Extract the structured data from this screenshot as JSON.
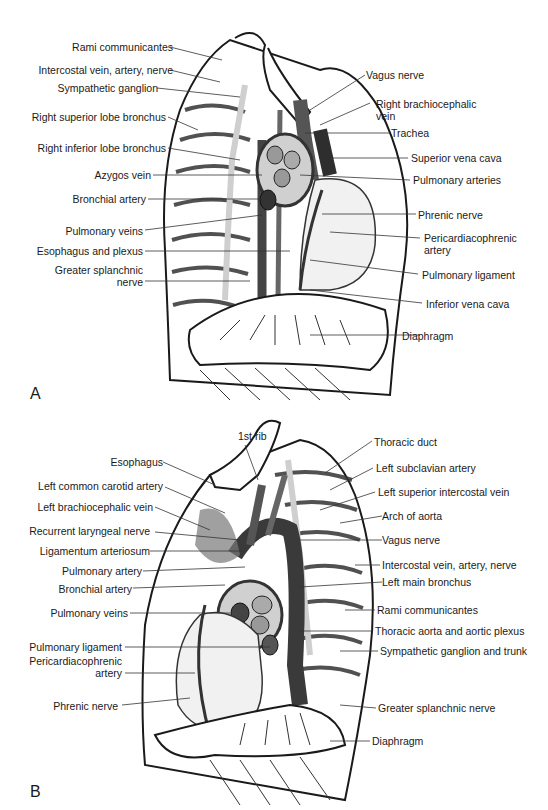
{
  "figure": {
    "panels": [
      {
        "letter": "A",
        "view": "right mediastinum (lateral)",
        "left_labels": [
          "Rami communicantes",
          "Intercostal vein, artery, nerve",
          "Sympathetic ganglion",
          "Right superior lobe bronchus",
          "Right inferior lobe bronchus",
          "Azygos vein",
          "Bronchial artery",
          "Pulmonary veins",
          "Esophagus and plexus",
          "Greater splanchnic",
          "nerve"
        ],
        "right_labels": [
          "Vagus nerve",
          "Right brachiocephalic",
          "vein",
          "Trachea",
          "Superior vena cava",
          "Pulmonary arteries",
          "Phrenic nerve",
          "Pericardiacophrenic",
          "artery",
          "Pulmonary ligament",
          "Inferior vena cava",
          "Diaphragm"
        ]
      },
      {
        "letter": "B",
        "view": "left mediastinum (lateral)",
        "top_labels": [
          "1st rib"
        ],
        "left_labels": [
          "Esophagus",
          "Left common carotid artery",
          "Left brachiocephalic vein",
          "Recurrent laryngeal nerve",
          "Ligamentum arteriosum",
          "Pulmonary artery",
          "Bronchial artery",
          "Pulmonary veins",
          "Pulmonary ligament",
          "Pericardiacophrenic",
          "artery",
          "Phrenic nerve"
        ],
        "right_labels": [
          "Thoracic duct",
          "Left subclavian artery",
          "Left superior intercostal vein",
          "Arch of aorta",
          "Vagus nerve",
          "Intercostal vein, artery, nerve",
          "Left main bronchus",
          "Rami communicantes",
          "Thoracic aorta and aortic plexus",
          "Sympathetic ganglion and trunk",
          "Greater splanchnic nerve",
          "Diaphragm"
        ]
      }
    ]
  },
  "colors": {
    "line": "#1a1a1a",
    "dark_vessel": "#3a3a3a",
    "mid_gray": "#8a8a8a",
    "light_gray": "#d8d8d8",
    "background": "#ffffff"
  }
}
